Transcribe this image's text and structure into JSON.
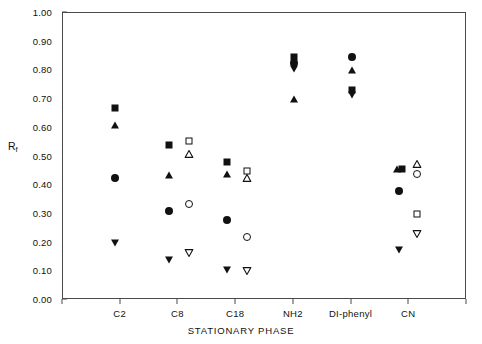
{
  "chart_data": {
    "type": "scatter",
    "title": "",
    "xlabel": "STATIONARY PHASE",
    "ylabel": "Rf",
    "ylabel_base": "R",
    "ylabel_sub": "f",
    "categories": [
      "C2",
      "C8",
      "C18",
      "NH2",
      "DI-phenyl",
      "CN"
    ],
    "ylim": [
      0.0,
      1.0
    ],
    "ytick_labels": [
      "0.00",
      "0.10",
      "0.20",
      "0.30",
      "0.40",
      "0.50",
      "0.60",
      "0.70",
      "0.80",
      "0.90",
      "1.00"
    ],
    "ytick_values": [
      0.0,
      0.1,
      0.2,
      0.3,
      0.4,
      0.5,
      0.6,
      0.7,
      0.8,
      0.9,
      1.0
    ],
    "grid": false,
    "legend": "none",
    "marker_color": "#111111",
    "frame_color": "#4a4a4a",
    "background": "#ffffff",
    "series": [
      {
        "name": "filled-square",
        "marker": "square-filled",
        "points": [
          {
            "category": "C2",
            "x_offset": -0.1,
            "value": 0.67
          },
          {
            "category": "C8",
            "x_offset": -0.16,
            "value": 0.54
          },
          {
            "category": "C18",
            "x_offset": -0.16,
            "value": 0.48
          },
          {
            "category": "NH2",
            "x_offset": 0.0,
            "value": 0.845
          },
          {
            "category": "DI-phenyl",
            "x_offset": 0.0,
            "value": 0.73
          },
          {
            "category": "CN",
            "x_offset": -0.12,
            "value": 0.455
          }
        ]
      },
      {
        "name": "filled-triangle-up",
        "marker": "triangle-up-filled",
        "points": [
          {
            "category": "C2",
            "x_offset": -0.1,
            "value": 0.61
          },
          {
            "category": "C8",
            "x_offset": -0.16,
            "value": 0.435
          },
          {
            "category": "C18",
            "x_offset": -0.16,
            "value": 0.44
          },
          {
            "category": "NH2",
            "x_offset": 0.0,
            "value": 0.7
          },
          {
            "category": "DI-phenyl",
            "x_offset": 0.0,
            "value": 0.8
          },
          {
            "category": "CN",
            "x_offset": -0.22,
            "value": 0.455
          }
        ]
      },
      {
        "name": "filled-circle",
        "marker": "circle-filled",
        "points": [
          {
            "category": "C2",
            "x_offset": -0.1,
            "value": 0.425
          },
          {
            "category": "C8",
            "x_offset": -0.16,
            "value": 0.31
          },
          {
            "category": "C18",
            "x_offset": -0.16,
            "value": 0.28
          },
          {
            "category": "NH2",
            "x_offset": 0.0,
            "value": 0.825
          },
          {
            "category": "DI-phenyl",
            "x_offset": 0.0,
            "value": 0.845
          },
          {
            "category": "CN",
            "x_offset": -0.18,
            "value": 0.38
          }
        ]
      },
      {
        "name": "filled-triangle-down",
        "marker": "triangle-down-filled",
        "points": [
          {
            "category": "C2",
            "x_offset": -0.1,
            "value": 0.2
          },
          {
            "category": "C8",
            "x_offset": -0.16,
            "value": 0.14
          },
          {
            "category": "C18",
            "x_offset": -0.16,
            "value": 0.105
          },
          {
            "category": "NH2",
            "x_offset": 0.0,
            "value": 0.805
          },
          {
            "category": "DI-phenyl",
            "x_offset": 0.0,
            "value": 0.715
          },
          {
            "category": "CN",
            "x_offset": -0.18,
            "value": 0.175
          }
        ]
      },
      {
        "name": "open-square",
        "marker": "square-open",
        "points": [
          {
            "category": "C8",
            "x_offset": 0.18,
            "value": 0.555
          },
          {
            "category": "C18",
            "x_offset": 0.18,
            "value": 0.45
          },
          {
            "category": "CN",
            "x_offset": 0.14,
            "value": 0.3
          }
        ]
      },
      {
        "name": "open-triangle-up",
        "marker": "triangle-up-open",
        "points": [
          {
            "category": "C8",
            "x_offset": 0.18,
            "value": 0.51
          },
          {
            "category": "C18",
            "x_offset": 0.18,
            "value": 0.425
          },
          {
            "category": "CN",
            "x_offset": 0.14,
            "value": 0.475
          }
        ]
      },
      {
        "name": "open-circle",
        "marker": "circle-open",
        "points": [
          {
            "category": "C8",
            "x_offset": 0.18,
            "value": 0.335
          },
          {
            "category": "C18",
            "x_offset": 0.18,
            "value": 0.22
          },
          {
            "category": "CN",
            "x_offset": 0.14,
            "value": 0.44
          }
        ]
      },
      {
        "name": "open-triangle-down",
        "marker": "triangle-down-open",
        "points": [
          {
            "category": "C8",
            "x_offset": 0.18,
            "value": 0.165
          },
          {
            "category": "C18",
            "x_offset": 0.18,
            "value": 0.1
          },
          {
            "category": "CN",
            "x_offset": 0.14,
            "value": 0.23
          }
        ]
      }
    ]
  }
}
